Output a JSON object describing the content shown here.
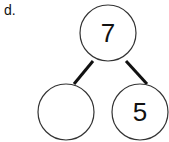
{
  "problem_label": "d.",
  "bond": {
    "whole": "7",
    "part_left": "",
    "part_right": "5"
  },
  "colors": {
    "stroke": "#333333",
    "line": "#111111",
    "text": "#111111"
  }
}
